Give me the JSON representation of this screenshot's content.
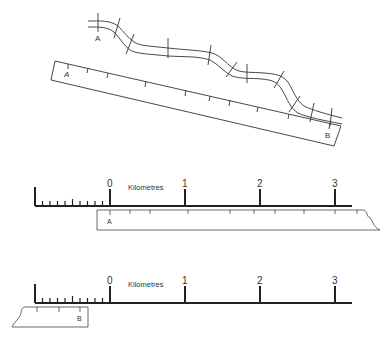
{
  "diagram": {
    "top_panel": {
      "route_start_label": "A",
      "route_end_label": "B",
      "strip_start_label": "A",
      "strip_end_label": "B"
    },
    "middle_panel": {
      "scale_unit_label": "Kilometres",
      "scale_ticks": [
        "0",
        "1",
        "2",
        "3"
      ],
      "strip_label": "A"
    },
    "bottom_panel": {
      "scale_unit_label": "Kilometres",
      "scale_ticks": [
        "0",
        "1",
        "2",
        "3"
      ],
      "strip_label": "B"
    },
    "colors": {
      "line": "#333333",
      "scale_bar": "#222222",
      "background": "#ffffff"
    }
  }
}
